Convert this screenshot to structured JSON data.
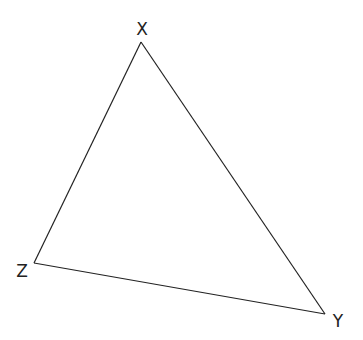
{
  "diagram": {
    "type": "triangle",
    "vertices": [
      {
        "id": "X",
        "label": "X"
      },
      {
        "id": "Y",
        "label": "Y"
      },
      {
        "id": "Z",
        "label": "Z"
      }
    ],
    "edges": [
      {
        "from": "X",
        "to": "Y"
      },
      {
        "from": "Y",
        "to": "Z"
      },
      {
        "from": "Z",
        "to": "X"
      }
    ],
    "stroke_color": "#222222",
    "background_color": "#ffffff"
  }
}
